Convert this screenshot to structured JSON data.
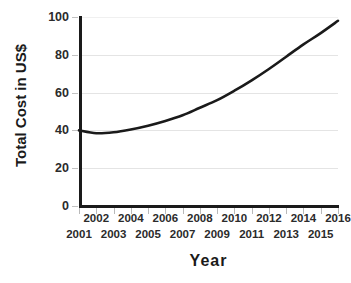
{
  "chart_data": {
    "type": "line",
    "title": "",
    "xlabel": "Year",
    "ylabel": "Total Cost in US$",
    "xlim": [
      2001,
      2016
    ],
    "ylim": [
      0,
      100
    ],
    "grid": true,
    "legend": "none",
    "line_color": "#1a1a1a",
    "gridline_color": "#e4e4e4",
    "axis_color": "#1a1a1a",
    "y_ticks": [
      0,
      20,
      40,
      60,
      80,
      100
    ],
    "y_tick_labels": [
      "0",
      "20",
      "40",
      "60",
      "80",
      "100"
    ],
    "x_ticks": [
      2001,
      2002,
      2003,
      2004,
      2005,
      2006,
      2007,
      2008,
      2009,
      2010,
      2011,
      2012,
      2013,
      2014,
      2015,
      2016
    ],
    "x_tick_labels_lower_row": [
      "2001",
      "2003",
      "2005",
      "2007",
      "2009",
      "2011",
      "2013",
      "2015"
    ],
    "x_tick_labels_upper_row": [
      "2002",
      "2004",
      "2006",
      "2008",
      "2010",
      "2012",
      "2014",
      "2016"
    ],
    "x": [
      2001,
      2002,
      2003,
      2004,
      2005,
      2006,
      2007,
      2008,
      2009,
      2010,
      2011,
      2012,
      2013,
      2014,
      2015,
      2016
    ],
    "values": [
      40,
      38.5,
      39,
      40.5,
      42.5,
      45,
      48,
      52,
      56,
      61,
      66.5,
      72.5,
      79,
      85.5,
      91.5,
      98
    ],
    "series": [
      {
        "name": "Total Cost",
        "values": [
          40,
          38.5,
          39,
          40.5,
          42.5,
          45,
          48,
          52,
          56,
          61,
          66.5,
          72.5,
          79,
          85.5,
          91.5,
          98
        ]
      }
    ]
  }
}
